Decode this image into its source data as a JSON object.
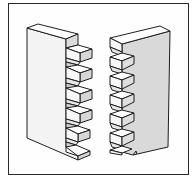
{
  "figure": {
    "colors": {
      "outline": "#1e1e1e",
      "face_light": "#f4f4f4",
      "face_white": "#ffffff",
      "face_shaded": "#d8d8d8",
      "face_mid": "#e6e6e6",
      "frame": "#2a2a2a"
    },
    "left_board": {
      "label": "",
      "pin_count": 6
    },
    "right_board": {
      "label": "",
      "pin_count": 6
    }
  }
}
